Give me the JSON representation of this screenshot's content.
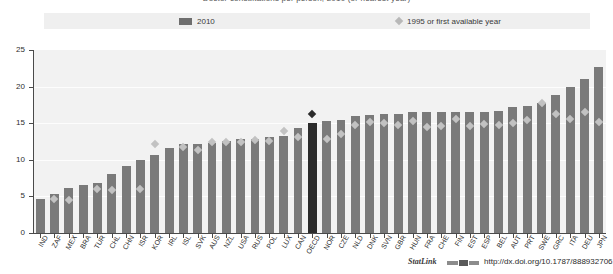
{
  "title": "Doctor consultations per person, 2010 (or nearest year)",
  "legend": {
    "series1": "2010",
    "series2": "1995 or first available year"
  },
  "footer": {
    "statlink_label": "StatLink",
    "statlink_icon": "statlink-icon",
    "url": "http://dx.doi.org/10.1787/888932706128"
  },
  "axis": {
    "yticks": [
      "0",
      "5",
      "10",
      "15",
      "20",
      "25"
    ],
    "ymin": 0,
    "ymax": 25
  },
  "colors": {
    "bar_2010": "#7a7a7a",
    "bar_highlight": "#2b2b2b",
    "diamond_1995": "#c2c2c2",
    "diamond_highlight": "#2b2b2b",
    "plot_background": "#f2f2f2",
    "legend_background": "#efefef",
    "axis": "#4a4a4a"
  },
  "chart_data": {
    "type": "bar",
    "title": "Doctor consultations per person, 2010 (or nearest year)",
    "xlabel": "",
    "ylabel": "",
    "ylim": [
      0,
      25
    ],
    "grid": true,
    "legend_position": "top",
    "highlight_category": "OECD",
    "categories": [
      "IND",
      "ZAF",
      "MEX",
      "BRA",
      "TUR",
      "CHL",
      "CHN",
      "ISR",
      "KOR",
      "IRL",
      "ISL",
      "SVK",
      "AUS",
      "NZL",
      "USA",
      "RUS",
      "POL",
      "LUX",
      "CAN",
      "OECD",
      "NOR",
      "CZE",
      "NLD",
      "DNK",
      "SVN",
      "GBR",
      "HUN",
      "FRA",
      "CHE",
      "FIN",
      "EST",
      "ESP",
      "BEL",
      "AUT",
      "PRT",
      "SWE",
      "GRC",
      "ITA",
      "DEU",
      "JPN"
    ],
    "series": [
      {
        "name": "2010",
        "type": "bar",
        "values": [
          4.6,
          5.3,
          6.1,
          6.6,
          6.9,
          8.1,
          9.1,
          10.0,
          10.6,
          11.6,
          12.1,
          12.1,
          12.3,
          12.6,
          12.8,
          12.9,
          13.1,
          13.3,
          14.3,
          15.0,
          15.3,
          15.5,
          16.0,
          16.1,
          16.2,
          16.3,
          16.5,
          16.5,
          16.5,
          16.6,
          16.6,
          16.6,
          16.7,
          17.2,
          17.4,
          17.8,
          18.8,
          19.9,
          21.0,
          22.7
        ]
      },
      {
        "name": "1995 or first available year",
        "type": "scatter",
        "marker": "diamond",
        "values": [
          null,
          4.6,
          4.5,
          null,
          6.0,
          5.9,
          null,
          6.0,
          12.1,
          null,
          11.8,
          11.4,
          12.4,
          12.5,
          12.4,
          12.7,
          12.6,
          13.9,
          13.1,
          16.2,
          12.8,
          13.5,
          14.8,
          15.1,
          15.0,
          14.7,
          15.3,
          14.5,
          14.6,
          15.6,
          14.6,
          14.9,
          14.8,
          15.0,
          15.5,
          17.8,
          16.3,
          15.6,
          16.5,
          15.1
        ]
      }
    ]
  }
}
